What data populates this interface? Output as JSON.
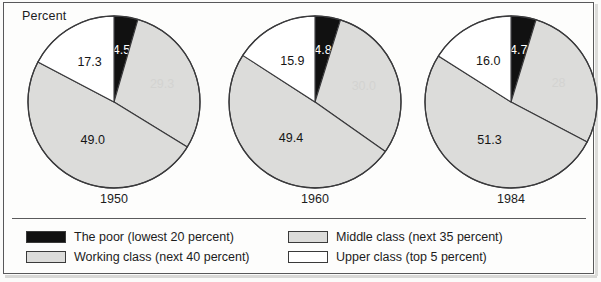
{
  "figure": {
    "axis_note": "Percent",
    "frame_color": "#58585a"
  },
  "legend": {
    "columns": [
      {
        "entries": [
          {
            "label": "The poor (lowest 20 percent)",
            "swatch": "black-swatch",
            "color": "#111111"
          },
          {
            "label": "Working class (next 40 percent)",
            "swatch": "gray-swatch",
            "color": "#dcdcda"
          }
        ]
      },
      {
        "entries": [
          {
            "label": "Middle class (next 35 percent)",
            "swatch": "gray-swatch",
            "color": "#dcdcda"
          },
          {
            "label": "Upper class (top 5 percent)",
            "swatch": "white-swatch",
            "color": "#ffffff"
          }
        ]
      }
    ]
  },
  "chart_data": {
    "type": "pie",
    "title": "",
    "subtitle": "",
    "ylabel": "Percent",
    "xlabel": "",
    "legend_position": "bottom",
    "grid": false,
    "categories": [
      "The poor (lowest 20 percent)",
      "Middle class (next 35 percent)",
      "Working class (next 40 percent)",
      "Upper class (top 5 percent)"
    ],
    "category_colors": [
      "#111111",
      "#dcdcda",
      "#dcdcda",
      "#ffffff"
    ],
    "pies": [
      {
        "name": "1950",
        "year_label": "1950",
        "slices": [
          {
            "category": "The poor (lowest 20 percent)",
            "value": 4.5,
            "label": "4.5",
            "label_color": "#ffffff",
            "fill": "#111111"
          },
          {
            "category": "Middle class (next 35 percent)",
            "value": 29.3,
            "label": "29.3",
            "label_color": "#d3d3d1",
            "fill": "#dcdcda"
          },
          {
            "category": "Working class (next 40 percent)",
            "value": 49.0,
            "label": "49.0",
            "label_color": "#151515",
            "fill": "#dcdcda"
          },
          {
            "category": "Upper class (top 5 percent)",
            "value": 17.3,
            "label": "17.3",
            "label_color": "#151515",
            "fill": "#ffffff"
          }
        ]
      },
      {
        "name": "1960",
        "year_label": "1960",
        "slices": [
          {
            "category": "The poor (lowest 20 percent)",
            "value": 4.8,
            "label": "4.8",
            "label_color": "#ffffff",
            "fill": "#111111"
          },
          {
            "category": "Middle class (next 35 percent)",
            "value": 30.0,
            "label": "30.0",
            "label_color": "#d3d3d1",
            "fill": "#dcdcda"
          },
          {
            "category": "Working class (next 40 percent)",
            "value": 49.4,
            "label": "49.4",
            "label_color": "#151515",
            "fill": "#dcdcda"
          },
          {
            "category": "Upper class (top 5 percent)",
            "value": 15.9,
            "label": "15.9",
            "label_color": "#151515",
            "fill": "#ffffff"
          }
        ]
      },
      {
        "name": "1984",
        "year_label": "1984",
        "slices": [
          {
            "category": "The poor (lowest 20 percent)",
            "value": 4.7,
            "label": "4.7",
            "label_color": "#ffffff",
            "fill": "#111111"
          },
          {
            "category": "Middle class (next 35 percent)",
            "value": 28.0,
            "label": "28",
            "label_color": "#d3d3d1",
            "fill": "#dcdcda"
          },
          {
            "category": "Working class (next 40 percent)",
            "value": 51.3,
            "label": "51.3",
            "label_color": "#151515",
            "fill": "#dcdcda"
          },
          {
            "category": "Upper class (top 5 percent)",
            "value": 16.0,
            "label": "16.0",
            "label_color": "#151515",
            "fill": "#ffffff"
          }
        ]
      }
    ]
  }
}
